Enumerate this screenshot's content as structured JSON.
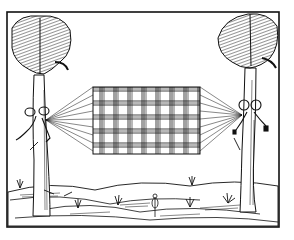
{
  "image": {
    "alt": "Woodcut illustration of a woven hammock strung between two palm-like trees over a hilly landscape",
    "style": "black-and-white woodcut",
    "subjects": [
      "left tree",
      "right tree",
      "hammock",
      "rope knots",
      "ground with grass tufts"
    ],
    "colors": {
      "ink": "#111111",
      "paper": "#ffffff"
    }
  }
}
